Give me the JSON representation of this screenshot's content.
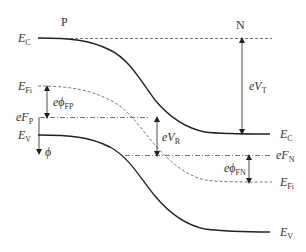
{
  "figure": {
    "regions": {
      "left": "P",
      "right": "N"
    },
    "labels": {
      "ec_left": {
        "main": "E",
        "sub": "C"
      },
      "ec_right": {
        "main": "E",
        "sub": "C"
      },
      "efi_left": {
        "main": "E",
        "sub": "Fi"
      },
      "efi_right": {
        "main": "E",
        "sub": "Fi"
      },
      "efp": {
        "pre": "e",
        "main": "F",
        "sub": "P"
      },
      "efn": {
        "pre": "e",
        "main": "F",
        "sub": "N"
      },
      "ev_left": {
        "main": "E",
        "sub": "V"
      },
      "ev_right": {
        "main": "E",
        "sub": "V"
      },
      "phi": "ϕ",
      "e_phi_fp": {
        "pre": "e",
        "main": "ϕ",
        "sub": "FP"
      },
      "e_phi_fn": {
        "pre": "e",
        "main": "ϕ",
        "sub": "FN"
      },
      "e_vt": {
        "pre": "e",
        "main": "V",
        "sub": "T"
      },
      "e_vr": {
        "pre": "e",
        "main": "V",
        "sub": "R"
      }
    },
    "curves": [
      {
        "name": "conduction-band",
        "style": "solid"
      },
      {
        "name": "intrinsic-fermi-level",
        "style": "dashed"
      },
      {
        "name": "valence-band",
        "style": "solid"
      },
      {
        "name": "p-quasi-fermi-level",
        "style": "dash-dot"
      },
      {
        "name": "n-quasi-fermi-level",
        "style": "dash-dot"
      },
      {
        "name": "ec-reference-level",
        "style": "dashed"
      }
    ],
    "arrows": [
      {
        "name": "total-potential-arrow",
        "label": "eV_T"
      },
      {
        "name": "reverse-bias-arrow",
        "label": "eV_R"
      },
      {
        "name": "fermi-potential-p-arrow",
        "label": "eϕ_FP"
      },
      {
        "name": "fermi-potential-n-arrow",
        "label": "eϕ_FN"
      },
      {
        "name": "potential-direction-arrow",
        "label": "ϕ"
      }
    ]
  }
}
